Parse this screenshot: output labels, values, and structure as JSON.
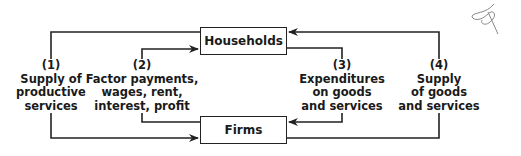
{
  "diagram": {
    "type": "circular-flow",
    "nodes": {
      "households": "Households",
      "firms": "Firms"
    },
    "flows": [
      {
        "number": "(1)",
        "lines": [
          "Supply of",
          "productive",
          "services"
        ],
        "from": "Households",
        "to": "Firms"
      },
      {
        "number": "(2)",
        "lines": [
          "Factor payments,",
          "wages, rent,",
          "interest, profit"
        ],
        "from": "Firms",
        "to": "Households"
      },
      {
        "number": "(3)",
        "lines": [
          "Expenditures",
          "on goods",
          "and services"
        ],
        "from": "Households",
        "to": "Firms"
      },
      {
        "number": "(4)",
        "lines": [
          "Supply",
          "of goods",
          "and services"
        ],
        "from": "Firms",
        "to": "Households"
      }
    ],
    "colors": {
      "line": "#222222",
      "background": "#ffffff"
    }
  }
}
